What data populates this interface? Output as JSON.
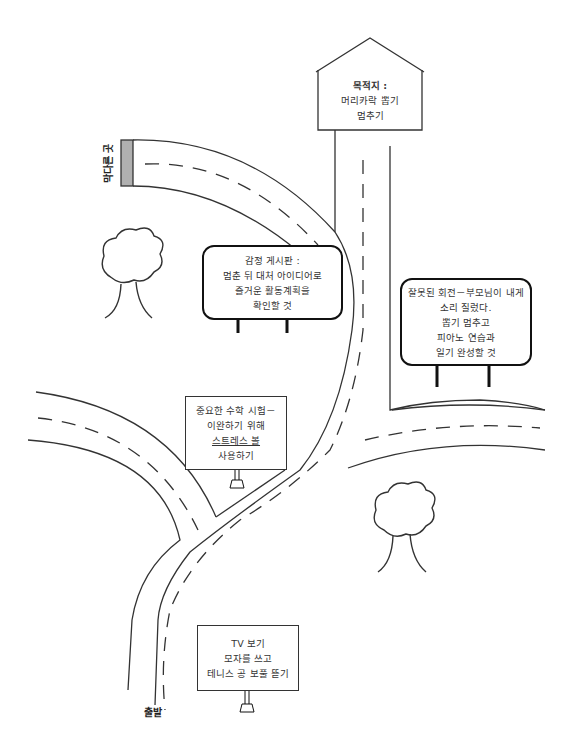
{
  "diagram": {
    "type": "road map metaphor",
    "start_label": "출발",
    "dead_end_label": "막다른 곳",
    "destination": {
      "title": "목적지 :",
      "lines": [
        "머리카락 뽑기",
        "멈추기"
      ]
    },
    "signs": [
      {
        "id": "emotion-board",
        "lines": [
          "감정 게시판 :",
          "멈춘 뒤 대처 아이디어로",
          "즐거운 활동계획을",
          "확인할 것"
        ]
      },
      {
        "id": "wrong-turn",
        "lines": [
          "잘못된 회전－부모님이 내게",
          "소리 질렀다.",
          "뽑기 멈추고",
          "피아노 연습과",
          "일기 완성할 것"
        ]
      },
      {
        "id": "math-test",
        "lines": [
          "중요한 수학 시험－",
          "이완하기 위해",
          "스트레스 볼",
          "사용하기"
        ]
      },
      {
        "id": "tv",
        "lines": [
          "TV 보기",
          "모자를 쓰고",
          "테니스 공 보풀 뜯기"
        ]
      }
    ],
    "decorations": [
      "tree",
      "tree"
    ],
    "colors": {
      "line": "#333333",
      "dead_end_block": "#b0b0b0",
      "background": "#ffffff"
    }
  }
}
